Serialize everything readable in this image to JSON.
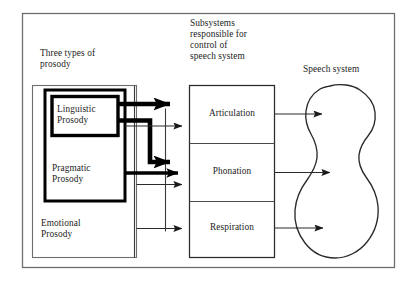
{
  "figure": {
    "title_left": "Three types of\nprosody",
    "title_middle": "Subsystems\nresponsible for\ncontrol of\nspeech system",
    "title_right": "Speech system"
  },
  "prosody": {
    "group_label": "Three types of prosody",
    "boxes": [
      {
        "id": "linguistic",
        "label": "Linguistic\nProsody",
        "emphasis": "bold"
      },
      {
        "id": "pragmatic",
        "label": "Pragmatic\nProsody",
        "emphasis": "bold"
      },
      {
        "id": "emotional",
        "label": "Emotional\nProsody",
        "emphasis": "thin"
      }
    ]
  },
  "subsystems": {
    "group_label": "Subsystems responsible for control of speech system",
    "boxes": [
      {
        "id": "articulation",
        "label": "Articulation"
      },
      {
        "id": "phonation",
        "label": "Phonation"
      },
      {
        "id": "respiration",
        "label": "Respiration"
      }
    ]
  },
  "speech_system": {
    "label": "Speech system",
    "shape": "organ-outline-blob"
  },
  "connections": [
    {
      "from": "linguistic",
      "to": "articulation",
      "weight": "thick"
    },
    {
      "from": "linguistic",
      "to": "phonation",
      "weight": "thick"
    },
    {
      "from": "pragmatic",
      "to": "articulation",
      "weight": "thin"
    },
    {
      "from": "pragmatic",
      "to": "phonation",
      "weight": "thick"
    },
    {
      "from": "emotional",
      "to": "phonation",
      "weight": "thin"
    },
    {
      "from": "emotional",
      "to": "respiration",
      "weight": "thin"
    },
    {
      "from": "articulation",
      "to": "speech_system",
      "weight": "thin"
    },
    {
      "from": "phonation",
      "to": "speech_system",
      "weight": "thin"
    },
    {
      "from": "respiration",
      "to": "speech_system",
      "weight": "thin"
    }
  ],
  "colors": {
    "frame": "#6e6e6e",
    "line": "#2a2a2a",
    "bold_line": "#000000",
    "text": "#1c1c1c",
    "background": "#ffffff"
  }
}
